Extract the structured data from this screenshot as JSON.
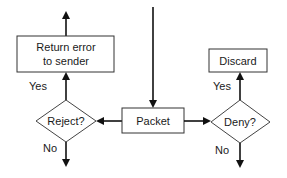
{
  "diagram": {
    "type": "flowchart",
    "colors": {
      "stroke": "#333333",
      "fill": "#ffffff",
      "text": "#1a1a1a"
    },
    "nodes": {
      "return_error": {
        "shape": "rectangle",
        "line1": "Return error",
        "line2": "to sender"
      },
      "discard": {
        "shape": "rectangle",
        "label": "Discard"
      },
      "reject": {
        "shape": "diamond",
        "label": "Reject?"
      },
      "packet": {
        "shape": "rectangle",
        "label": "Packet"
      },
      "deny": {
        "shape": "diamond",
        "label": "Deny?"
      }
    },
    "edges": [
      {
        "from": "top-input",
        "to": "packet",
        "label": ""
      },
      {
        "from": "packet",
        "to": "reject",
        "label": ""
      },
      {
        "from": "packet",
        "to": "deny",
        "label": ""
      },
      {
        "from": "reject",
        "to": "return_error",
        "label": "Yes"
      },
      {
        "from": "reject",
        "to": "bottom-exit",
        "label": "No"
      },
      {
        "from": "deny",
        "to": "discard",
        "label": "Yes"
      },
      {
        "from": "deny",
        "to": "bottom-exit",
        "label": "No"
      },
      {
        "from": "return_error",
        "to": "top-exit",
        "label": ""
      }
    ],
    "edge_labels": {
      "reject_yes": "Yes",
      "reject_no": "No",
      "deny_yes": "Yes",
      "deny_no": "No"
    }
  }
}
